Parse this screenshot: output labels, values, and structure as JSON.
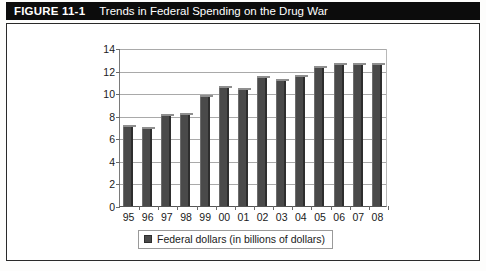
{
  "figure": {
    "label": "FIGURE 11-1",
    "title": "Trends in Federal Spending on the Drug War"
  },
  "chart_data": {
    "type": "bar",
    "title": "Trends in Federal Spending on the Drug War",
    "xlabel": "",
    "ylabel": "",
    "ylim": [
      0,
      14
    ],
    "yticks": [
      0,
      2,
      4,
      6,
      8,
      10,
      12,
      14
    ],
    "grid": true,
    "legend_position": "bottom",
    "categories": [
      "95",
      "96",
      "97",
      "98",
      "99",
      "00",
      "01",
      "02",
      "03",
      "04",
      "05",
      "06",
      "07",
      "08"
    ],
    "series": [
      {
        "name": "Federal dollars (in billions of dollars)",
        "color": "#4a4a4a",
        "values": [
          7.0,
          6.8,
          8.0,
          8.1,
          9.7,
          10.5,
          10.3,
          11.3,
          11.1,
          11.4,
          12.2,
          12.5,
          12.5,
          12.5
        ]
      }
    ]
  },
  "legend": {
    "entries": [
      {
        "label": "Federal dollars (in billions of dollars)",
        "color": "#4a4a4a"
      }
    ]
  },
  "colors": {
    "header_bg": "#0c0c0c",
    "header_text": "#ffffff",
    "bar": "#4a4a4a",
    "gridline": "#a9a9a9",
    "box_border": "#2a2a2a"
  }
}
